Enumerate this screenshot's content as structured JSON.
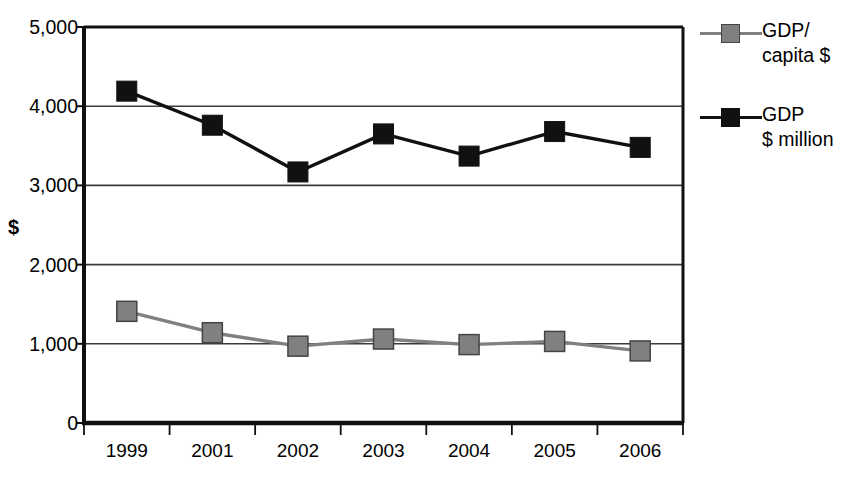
{
  "chart_data": {
    "type": "line",
    "title": "",
    "xlabel": "",
    "ylabel": "$",
    "categories": [
      "1999",
      "2001",
      "2002",
      "2003",
      "2004",
      "2005",
      "2006"
    ],
    "ylim": [
      0,
      5000
    ],
    "ytick_values": [
      0,
      1000,
      2000,
      3000,
      4000,
      5000
    ],
    "ytick_labels": [
      "0",
      "1,000",
      "2,000",
      "3,000",
      "4,000",
      "5,000"
    ],
    "grid": true,
    "grid_axis": "y",
    "legend_position": "right",
    "series": [
      {
        "name": "GDP/\ncapita $",
        "legend_label_line1": "GDP/",
        "legend_label_line2": "capita $",
        "color": "#808080",
        "marker": "square",
        "values": [
          1410,
          1140,
          970,
          1060,
          990,
          1030,
          910
        ]
      },
      {
        "name": "GDP\n$ million",
        "legend_label_line1": "GDP",
        "legend_label_line2": "$ million",
        "color": "#111111",
        "marker": "square",
        "values": [
          4190,
          3760,
          3170,
          3650,
          3370,
          3680,
          3480
        ]
      }
    ]
  },
  "colors": {
    "axis": "#111111",
    "gridline": "#3a3a3a",
    "background": "#ffffff",
    "series_gdp_per_capita": "#808080",
    "series_gdp_million": "#111111"
  }
}
